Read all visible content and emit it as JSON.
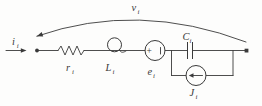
{
  "figure": {
    "type": "circuit-diagram",
    "background": "#fdfdfc",
    "ink": "#3a3a3a",
    "labels": {
      "input_current": {
        "base": "i",
        "sub": "i"
      },
      "resistor": {
        "base": "r",
        "sub": "i"
      },
      "inductor": {
        "base": "L",
        "sub": "i"
      },
      "emf_source": {
        "base": "e",
        "sub": "i"
      },
      "capacitor": {
        "base": "C",
        "sub": "i"
      },
      "current_source": {
        "base": "J",
        "sub": "i"
      },
      "port_voltage": {
        "base": "v",
        "sub": "i"
      },
      "emf_plus": "+"
    },
    "components": [
      {
        "name": "input-current-arrow",
        "symbol": "right-arrow",
        "label": "i_i"
      },
      {
        "name": "resistor",
        "symbol": "zigzag",
        "label": "r_i"
      },
      {
        "name": "inductor",
        "symbol": "single-loop-coil",
        "label": "L_i"
      },
      {
        "name": "emf-source",
        "symbol": "circle-plus-minus",
        "label": "e_i"
      },
      {
        "name": "capacitor",
        "symbol": "parallel-plates",
        "label": "C_i"
      },
      {
        "name": "current-source",
        "symbol": "circle-left-arrow",
        "label": "J_i"
      },
      {
        "name": "port-voltage-arc",
        "symbol": "curved-arrow-over-top",
        "label": "v_i"
      }
    ]
  }
}
